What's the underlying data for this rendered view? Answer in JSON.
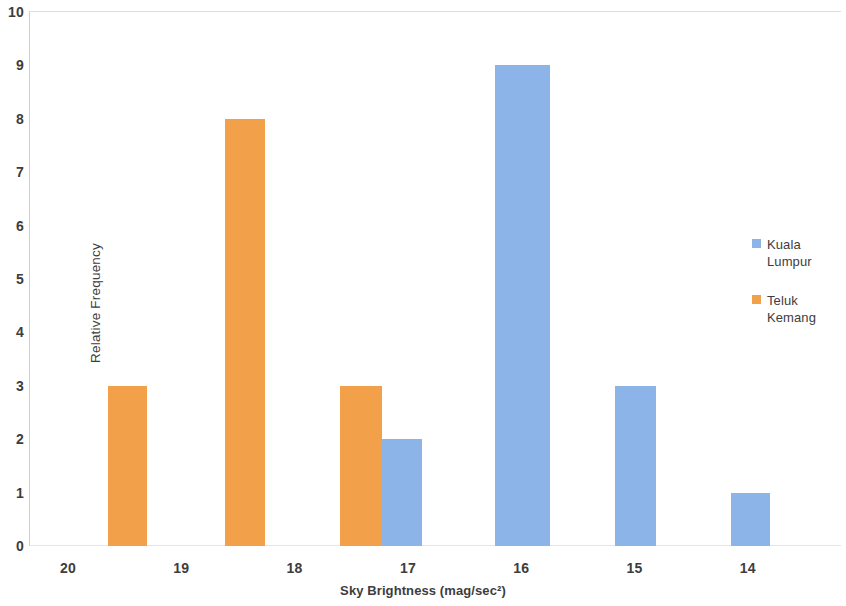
{
  "chart_data": {
    "type": "bar",
    "title": "",
    "xlabel": "Sky Brightness (mag/sec²)",
    "ylabel": "Relative Frequency",
    "xlim": [
      20.5,
      13.5
    ],
    "ylim": [
      0,
      10
    ],
    "x_tick_labels": [
      "20",
      "19",
      "18",
      "17",
      "16",
      "15",
      "14"
    ],
    "x_ticks": [
      20,
      19,
      18,
      17,
      16,
      15,
      14
    ],
    "y_tick_labels": [
      "0",
      "1",
      "2",
      "3",
      "4",
      "5",
      "6",
      "7",
      "8",
      "9",
      "10"
    ],
    "y_ticks": [
      0,
      1,
      2,
      3,
      4,
      5,
      6,
      7,
      8,
      9,
      10
    ],
    "x_axis_inverted": true,
    "grid": false,
    "legend_position": "right",
    "colors": {
      "kuala_lumpur": "#8CB4E8",
      "teluk_kemang": "#F2A04A",
      "axis_line": "#bcd3ea",
      "text": "#3d3d3d",
      "background": "#ffffff"
    },
    "series": [
      {
        "name": "Kuala Lumpur",
        "color": "#8CB4E8",
        "points": [
          {
            "x": 17.76,
            "value": 2
          },
          {
            "x": 16.25,
            "value": 9
          },
          {
            "x": 15.4,
            "value": 3
          },
          {
            "x": 14.3,
            "value": 1
          }
        ]
      },
      {
        "name": "Teluk Kemang",
        "color": "#F2A04A",
        "points": [
          {
            "x": 19.7,
            "value": 3
          },
          {
            "x": 18.67,
            "value": 8
          },
          {
            "x": 18.13,
            "value": 3
          }
        ]
      }
    ],
    "bars": [
      {
        "series": 1,
        "label": "Teluk Kemang",
        "value": 3,
        "left_px": 108,
        "width_px": 39
      },
      {
        "series": 1,
        "label": "Teluk Kemang",
        "value": 8,
        "left_px": 225,
        "width_px": 40
      },
      {
        "series": 1,
        "label": "Teluk Kemang",
        "value": 3,
        "left_px": 340,
        "width_px": 42
      },
      {
        "series": 0,
        "label": "Kuala Lumpur",
        "value": 2,
        "left_px": 382,
        "width_px": 40
      },
      {
        "series": 0,
        "label": "Kuala Lumpur",
        "value": 9,
        "left_px": 495,
        "width_px": 55
      },
      {
        "series": 0,
        "label": "Kuala Lumpur",
        "value": 3,
        "left_px": 615,
        "width_px": 41
      },
      {
        "series": 0,
        "label": "Kuala Lumpur",
        "value": 1,
        "left_px": 731,
        "width_px": 39
      }
    ]
  },
  "legend": {
    "items": [
      {
        "label": "Kuala Lumpur",
        "color": "#8CB4E8"
      },
      {
        "label": "Teluk Kemang",
        "color": "#F2A04A"
      }
    ]
  }
}
